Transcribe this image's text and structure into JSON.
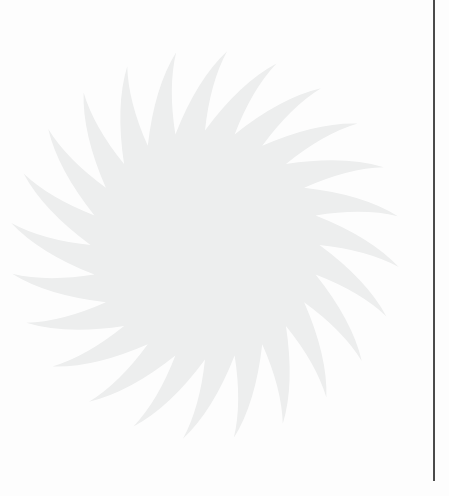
{
  "page": {
    "background_color": "#ffffff",
    "width": 449,
    "height": 496
  },
  "watermark": {
    "name": "sunburst-watermark",
    "shape": "starburst",
    "fill_color": "#eff0f0",
    "petal_count": 24,
    "center_x": 205,
    "center_y": 245,
    "inner_radius": 118,
    "outer_radius": 195,
    "swirl_degrees": 14,
    "label": ""
  },
  "margin_rule": {
    "name": "vertical-margin-rule",
    "color": "#3a3a3a",
    "x": 433,
    "top": 0,
    "height": 481,
    "thickness": 2,
    "label": ""
  }
}
